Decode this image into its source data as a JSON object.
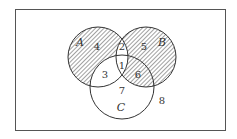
{
  "diagram": {
    "type": "venn",
    "sets": [
      {
        "name": "A",
        "cx": 98,
        "cy": 57,
        "r": 30
      },
      {
        "name": "B",
        "cx": 146,
        "cy": 57,
        "r": 30
      },
      {
        "name": "C",
        "cx": 122,
        "cy": 87,
        "r": 32
      }
    ],
    "region_labels": [
      {
        "id": "r1",
        "text": "1",
        "x": 122,
        "y": 69
      },
      {
        "id": "r2",
        "text": "2",
        "x": 122,
        "y": 50
      },
      {
        "id": "r3",
        "text": "3",
        "x": 105,
        "y": 78
      },
      {
        "id": "r4",
        "text": "4",
        "x": 97,
        "y": 50
      },
      {
        "id": "r5",
        "text": "5",
        "x": 144,
        "y": 50
      },
      {
        "id": "r6",
        "text": "6",
        "x": 138,
        "y": 78
      },
      {
        "id": "r7",
        "text": "7",
        "x": 122,
        "y": 94
      },
      {
        "id": "r8",
        "text": "8",
        "x": 162,
        "y": 104
      }
    ],
    "set_labels": [
      {
        "id": "A",
        "text": "A",
        "x": 80,
        "y": 46
      },
      {
        "id": "B",
        "text": "B",
        "x": 162,
        "y": 46
      },
      {
        "id": "C",
        "text": "C",
        "x": 121,
        "y": 111
      }
    ],
    "shaded_regions": [
      "4",
      "5",
      "6"
    ]
  }
}
